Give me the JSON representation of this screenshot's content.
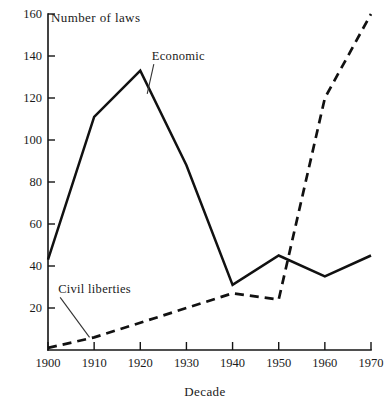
{
  "chart_data": {
    "type": "line",
    "title": "Number of laws",
    "xlabel": "Decade",
    "ylabel": "Number of laws",
    "x": [
      1900,
      1910,
      1920,
      1930,
      1940,
      1950,
      1960,
      1970
    ],
    "xtick_labels": [
      "1900",
      "1910",
      "1920",
      "1930",
      "1940",
      "1950",
      "1960",
      "1970"
    ],
    "ytick_labels": [
      "20",
      "40",
      "60",
      "80",
      "100",
      "120",
      "140",
      "160"
    ],
    "ytick_values": [
      20,
      40,
      60,
      80,
      100,
      120,
      140,
      160
    ],
    "xlim": [
      1900,
      1970
    ],
    "ylim": [
      0,
      160
    ],
    "grid": false,
    "legend": "inline-annotations",
    "series": [
      {
        "name": "Economic",
        "style": "solid",
        "color": "#111111",
        "values": [
          43,
          111,
          133,
          88,
          31,
          45,
          35,
          45
        ]
      },
      {
        "name": "Civil liberties",
        "style": "dashed",
        "color": "#111111",
        "values": [
          1,
          6,
          13,
          20,
          27,
          24,
          120,
          160
        ]
      }
    ],
    "annotations": [
      {
        "id": "economic-label",
        "text": "Economic",
        "label_x": 1922.5,
        "label_y": 138,
        "point_x": 1921.5,
        "point_y": 122
      },
      {
        "id": "civil-liberties-label",
        "text": "Civil liberties",
        "label_x": 1902.2,
        "label_y": 27,
        "point_x": 1909.0,
        "point_y": 6
      }
    ]
  },
  "axes": {
    "y_axis_name": "y-axis",
    "x_axis_name": "x-axis"
  }
}
